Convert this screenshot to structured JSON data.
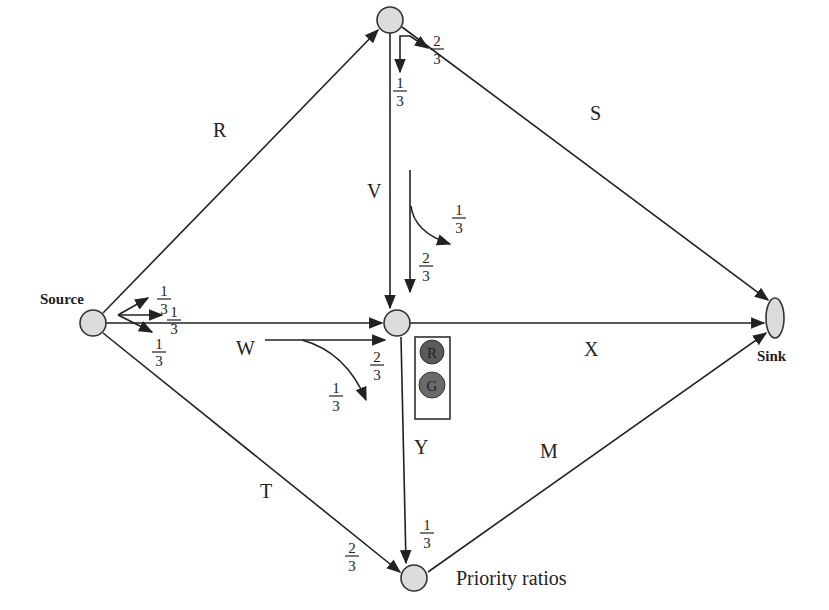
{
  "diagram": {
    "title": "",
    "nodes": {
      "source": {
        "label": "Source"
      },
      "sink": {
        "label": "Sink"
      },
      "top": {
        "label": ""
      },
      "center": {
        "label": ""
      },
      "bottom": {
        "label": "Priority ratios"
      }
    },
    "edges": {
      "R": "R",
      "S": "S",
      "V": "V",
      "W": "W",
      "X": "X",
      "Y": "Y",
      "T": "T",
      "M": "M"
    },
    "fractions": {
      "source_up": {
        "num": "1",
        "den": "3"
      },
      "source_mid": {
        "num": "1",
        "den": "3"
      },
      "source_down": {
        "num": "1",
        "den": "3"
      },
      "top_down": {
        "num": "1",
        "den": "3"
      },
      "top_right": {
        "num": "2",
        "den": "3"
      },
      "v_turn": {
        "num": "1",
        "den": "3"
      },
      "v_straight": {
        "num": "2",
        "den": "3"
      },
      "w_straight": {
        "num": "2",
        "den": "3"
      },
      "w_turn": {
        "num": "1",
        "den": "3"
      },
      "bottom_from_y": {
        "num": "1",
        "den": "3"
      },
      "bottom_from_t": {
        "num": "2",
        "den": "3"
      }
    },
    "traffic_light": {
      "red_label": "R",
      "green_label": "G",
      "red_color": "#5a5a5a",
      "green_color": "#6a6a6a"
    },
    "colors": {
      "line": "#222222",
      "node_fill": "#dcdcdc",
      "background": "#ffffff"
    }
  }
}
